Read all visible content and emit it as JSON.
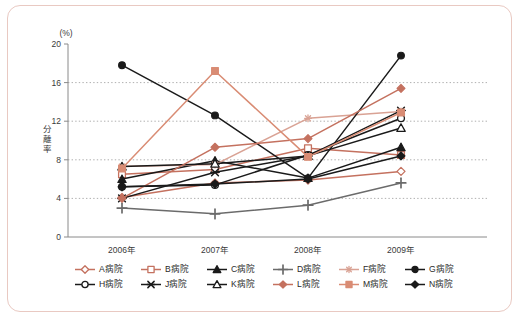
{
  "chart_data": {
    "type": "line",
    "title": "",
    "xlabel": "",
    "ylabel": "分離率",
    "yunit": "(%)",
    "categories": [
      "2006年",
      "2007年",
      "2008年",
      "2009年"
    ],
    "ylim": [
      0,
      20
    ],
    "yticks": [
      0,
      4,
      8,
      12,
      16,
      20
    ],
    "ytick_labels": [
      "0",
      "4",
      "8",
      "12",
      "16",
      "20"
    ],
    "grid": "horizontal-dotted",
    "legend_position": "bottom",
    "series": [
      {
        "name": "A病院",
        "values": [
          4.1,
          5.6,
          5.9,
          6.8
        ],
        "color": "#c4715f",
        "marker": "diamond-open"
      },
      {
        "name": "B病院",
        "values": [
          6.5,
          7.0,
          9.2,
          8.5
        ],
        "color": "#c4715f",
        "marker": "square-open"
      },
      {
        "name": "C病院",
        "values": [
          6.0,
          7.9,
          6.1,
          9.3
        ],
        "color": "#1a1a1a",
        "marker": "triangle-filled"
      },
      {
        "name": "D病院",
        "values": [
          3.0,
          2.4,
          3.3,
          5.6
        ],
        "color": "#6b6b6b",
        "marker": "plus"
      },
      {
        "name": "F病院",
        "values": [
          7.3,
          7.5,
          12.3,
          13.0
        ],
        "color": "#d9a294",
        "marker": "asterisk"
      },
      {
        "name": "G病院",
        "values": [
          17.8,
          12.6,
          6.1,
          18.8
        ],
        "color": "#1a1a1a",
        "marker": "circle-filled"
      },
      {
        "name": "H病院",
        "values": [
          5.2,
          5.4,
          8.5,
          12.3
        ],
        "color": "#1a1a1a",
        "marker": "circle-open"
      },
      {
        "name": "J病院",
        "values": [
          4.0,
          6.7,
          8.4,
          13.1
        ],
        "color": "#1a1a1a",
        "marker": "star"
      },
      {
        "name": "K病院",
        "values": [
          7.3,
          7.6,
          8.4,
          11.3
        ],
        "color": "#1a1a1a",
        "marker": "triangle-open"
      },
      {
        "name": "L病院",
        "values": [
          4.0,
          9.3,
          10.2,
          15.4
        ],
        "color": "#c4715f",
        "marker": "diamond-filled"
      },
      {
        "name": "M病院",
        "values": [
          7.1,
          17.2,
          8.3,
          12.9
        ],
        "color": "#d98c74",
        "marker": "square-filled"
      },
      {
        "name": "N病院",
        "values": [
          5.2,
          5.5,
          6.0,
          8.4
        ],
        "color": "#1a1a1a",
        "marker": "diamond-filled"
      }
    ]
  },
  "legend": {
    "rows": [
      [
        "A病院",
        "B病院",
        "C病院",
        "D病院",
        "F病院",
        "G病院"
      ],
      [
        "H病院",
        "J病院",
        "K病院",
        "L病院",
        "M病院",
        "N病院"
      ]
    ]
  },
  "colors": {
    "border": "#e9c9c2",
    "background": "#ffffff",
    "axis": "#8a8a8a",
    "grid": "#9a9a9a",
    "accent_red": "#c4715f",
    "accent_salmon": "#d98c74",
    "accent_pink": "#d9a294",
    "dark": "#1a1a1a",
    "gray": "#6b6b6b"
  }
}
